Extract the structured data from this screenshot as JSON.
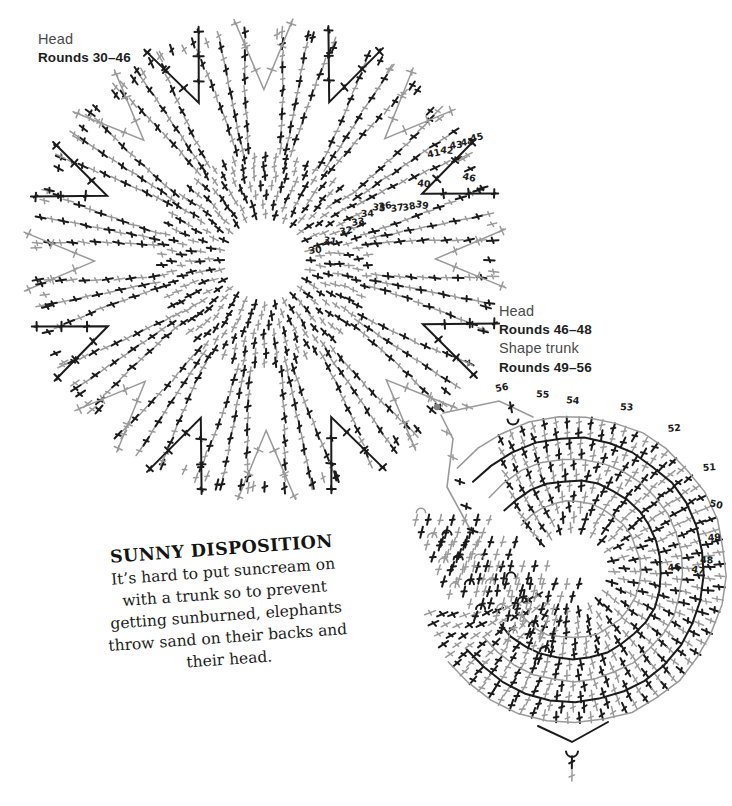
{
  "page": {
    "background": "#ffffff",
    "width": 732,
    "height": 806
  },
  "colors": {
    "stitch_black": "#1b1b1b",
    "stitch_gray": "#9a9a9a",
    "label_regular": "#4a4a4a",
    "label_bold": "#1d1d1d",
    "callout_text": "#141414",
    "start_dot": "#7d7d7d"
  },
  "labels": {
    "head_top": {
      "line1": "Head",
      "line2": "Rounds 30–46"
    },
    "head_trunk": {
      "line1": "Head",
      "line2": "Rounds 46–48",
      "line3": "Shape trunk",
      "line4": "Rounds 49–56"
    }
  },
  "callout": {
    "title": "SUNNY DISPOSITION",
    "body": "It’s hard to put suncream on with a trunk so to prevent getting sunburned, elephants throw sand on their backs and their head."
  },
  "chart_data": [
    {
      "id": "head-rounds-30-46",
      "type": "diagram",
      "title": "Head Rounds 30–46",
      "description": "Circular crochet stitch chart worked in the round, radiating spokes of treble crochet stitches around an open centre, with wedge-shaped gaps between spokes.",
      "center": [
        265,
        260
      ],
      "inner_radius": 42,
      "outer_radius": 232,
      "spokes": 16,
      "round_labels": [
        "30",
        "31",
        "32",
        "33",
        "34",
        "35",
        "36",
        "37",
        "38",
        "39",
        "40",
        "41",
        "42",
        "43",
        "44",
        "45",
        "46"
      ],
      "round_label_positions": [
        [
          309,
          254
        ],
        [
          323,
          243
        ],
        [
          340,
          235
        ],
        [
          352,
          226
        ],
        [
          361,
          217
        ],
        [
          372,
          210
        ],
        [
          379,
          210
        ],
        [
          391,
          212
        ],
        [
          403,
          211
        ],
        [
          415,
          207
        ],
        [
          417,
          186
        ],
        [
          428,
          158
        ],
        [
          440,
          153
        ],
        [
          450,
          149
        ],
        [
          461,
          146
        ],
        [
          471,
          142
        ],
        [
          462,
          179
        ]
      ],
      "stitch_symbols": [
        "treble-cross-black",
        "treble-cross-gray"
      ]
    },
    {
      "id": "head-trunk",
      "type": "diagram",
      "title": "Head Rounds 46–48 / Shape trunk Rounds 49–56",
      "description": "Spiral crochet stitch chart forming a horseshoe shape worked outward from a marked start point, with dense triangular stitch clusters forming the trunk shaping.",
      "center": [
        572,
        570
      ],
      "outer_radius": 150,
      "start_dot": [
        437,
        409
      ],
      "round_labels": [
        "56",
        "55",
        "54",
        "53",
        "52",
        "51",
        "50",
        "49",
        "48",
        "47",
        "46"
      ],
      "round_label_positions": [
        [
          496,
          392
        ],
        [
          536,
          397
        ],
        [
          566,
          403
        ],
        [
          620,
          410
        ],
        [
          668,
          432
        ],
        [
          703,
          471
        ],
        [
          709,
          506
        ],
        [
          708,
          541
        ],
        [
          700,
          563
        ],
        [
          691,
          572
        ],
        [
          668,
          571
        ]
      ],
      "stitch_symbols": [
        "treble-cross-black",
        "treble-cross-gray",
        "arc-hook-black",
        "arc-hook-gray"
      ]
    }
  ]
}
